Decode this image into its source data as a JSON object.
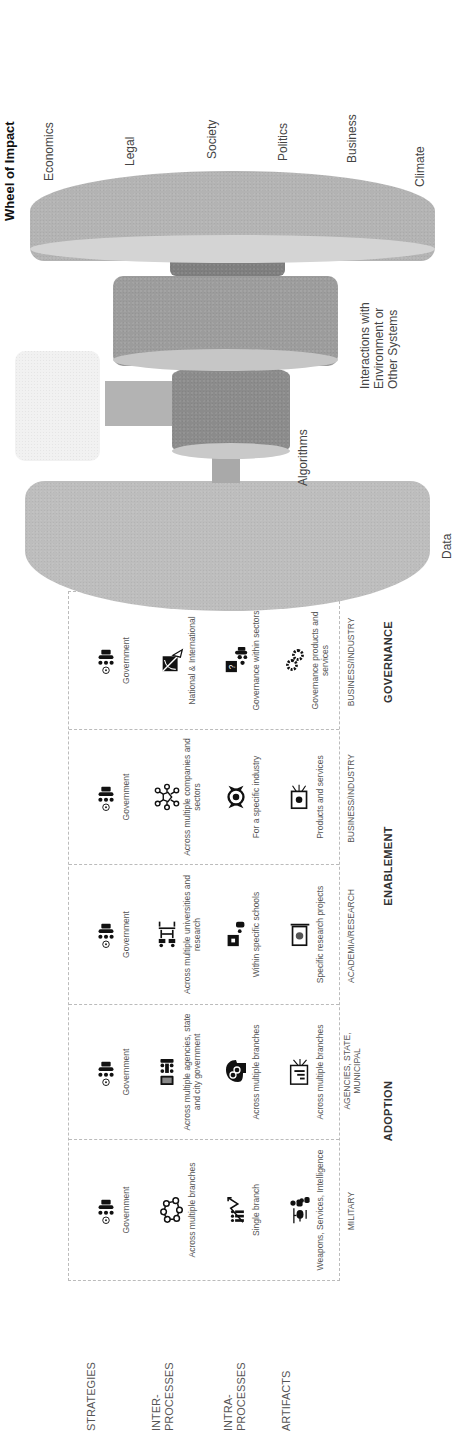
{
  "row_labels": [
    "STRATEGIES",
    "INTER-\nPROCESSES",
    "INTRA-\nPROCESSES",
    "ARTIFACTS"
  ],
  "table": {
    "columns": [
      {
        "label": "MILITARY",
        "cells": [
          {
            "icon": "government-icon",
            "text": "Government"
          },
          {
            "icon": "network-nodes-icon",
            "text": "Across multiple branches"
          },
          {
            "icon": "growth-chart-people-icon",
            "text": "Single branch"
          },
          {
            "icon": "helicopter-soldier-icon",
            "text": "Weapons, Services, Intelligence"
          }
        ]
      },
      {
        "label": "AGENCIES, STATE, MUNICIPAL",
        "cells": [
          {
            "icon": "government-icon",
            "text": "Government"
          },
          {
            "icon": "meeting-board-icon",
            "text": "Across multiple agencies, state and city government"
          },
          {
            "icon": "head-gears-icon",
            "text": "Across multiple branches"
          },
          {
            "icon": "presentation-chart-icon",
            "text": "Across multiple branches"
          }
        ]
      },
      {
        "label": "ACADEMIA/RESEARCH",
        "cells": [
          {
            "icon": "government-icon",
            "text": "Government"
          },
          {
            "icon": "classroom-desks-icon",
            "text": "Across multiple universities and research"
          },
          {
            "icon": "teacher-board-icon",
            "text": "Within specific schools"
          },
          {
            "icon": "laptop-globe-icon",
            "text": "Specific research projects"
          }
        ]
      },
      {
        "label": "BUSINESS/INDUSTRY",
        "cells": [
          {
            "icon": "government-icon",
            "text": "Government"
          },
          {
            "icon": "hub-network-icon",
            "text": "Across multiple companies and sectors"
          },
          {
            "icon": "target-hands-icon",
            "text": "For a specific industry"
          },
          {
            "icon": "product-screen-icon",
            "text": "Products and services"
          }
        ]
      },
      {
        "label": "BUSINESS/INDUSTRY",
        "cells": [
          {
            "icon": "government-icon",
            "text": "Government"
          },
          {
            "icon": "satellite-dish-icon",
            "text": "National & International"
          },
          {
            "icon": "question-board-people-icon",
            "text": "Governance within sectors"
          },
          {
            "icon": "gears-icon",
            "text": "Governance products and services"
          }
        ]
      }
    ],
    "groups": [
      {
        "label": "ADOPTION",
        "span": [
          0,
          1
        ]
      },
      {
        "label": "ENABLEMENT",
        "span": [
          2,
          3
        ]
      },
      {
        "label": "GOVERNANCE",
        "span": [
          4,
          4
        ]
      }
    ]
  },
  "diagram": {
    "title": "Wheel of Impact",
    "labels": {
      "data": "Data",
      "algorithms": "Algorithms",
      "interactions": "Interactions with\nEnvironment or\nOther Systems"
    },
    "impact_areas": [
      "Economics",
      "Legal",
      "Society",
      "Politics",
      "Business",
      "Climate"
    ],
    "colors": {
      "data_disk": "#b8b8b8",
      "algo_disk": "#8a8a8a",
      "interaction_disk": "#9a9a9a",
      "wheel_disk": "#b0b0b0",
      "hub": "#7c7c7c",
      "ghost_box": "#f0f0f0"
    }
  }
}
